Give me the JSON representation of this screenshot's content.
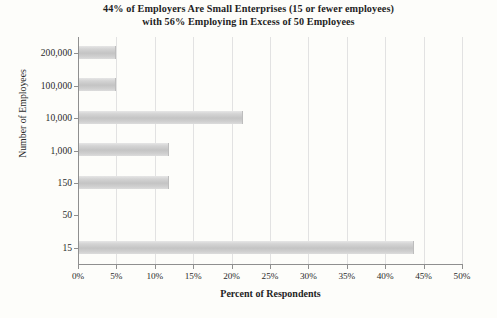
{
  "chart_data": {
    "type": "bar",
    "orientation": "horizontal",
    "title": "44% of Employers Are Small Enterprises (15 or fewer employees) with 56% Employing in Excess of 50 Employees",
    "title_lines": [
      "44% of Employers Are Small Enterprises (15 or fewer employees)",
      "with 56% Employing in Excess of 50 Employees"
    ],
    "xlabel": "Percent of Respondents",
    "ylabel": "Number of Employees",
    "categories": [
      "200,000",
      "100,000",
      "10,000",
      "1,000",
      "150",
      "50",
      "15"
    ],
    "values": [
      4.9,
      4.9,
      21.5,
      11.8,
      11.8,
      0,
      43.7
    ],
    "xlim": [
      0,
      50
    ],
    "ylim_note": "categorical",
    "xticks": [
      0,
      5,
      10,
      15,
      20,
      25,
      30,
      35,
      40,
      45,
      50
    ],
    "xtick_labels": [
      "0%",
      "5%",
      "10%",
      "15%",
      "20%",
      "25%",
      "30%",
      "35%",
      "40%",
      "45%",
      "50%"
    ],
    "grid": true,
    "grid_axis": "x",
    "legend": false,
    "bar_color": "#c8c8c8",
    "gridline_color": "#e2e2e2",
    "axis_color": "#8f8f8f",
    "background_color": "#fdfdfa"
  }
}
